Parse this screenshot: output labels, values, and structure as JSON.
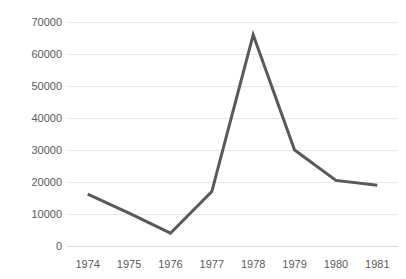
{
  "chart_data": {
    "type": "line",
    "title": "",
    "subtitle": "",
    "xlabel": "",
    "ylabel": "",
    "categories": [
      "1974",
      "1975",
      "1976",
      "1977",
      "1978",
      "1979",
      "1980",
      "1981"
    ],
    "values": [
      16200,
      10300,
      4000,
      17000,
      66000,
      30000,
      20500,
      19000
    ],
    "series": [
      {
        "name": "",
        "values": [
          16200,
          10300,
          4000,
          17000,
          66000,
          30000,
          20500,
          19000
        ]
      }
    ],
    "ylim": [
      0,
      70000
    ],
    "yticks": [
      0,
      10000,
      20000,
      30000,
      40000,
      50000,
      60000,
      70000
    ],
    "ytick_labels": [
      "0",
      "10000",
      "20000",
      "30000",
      "40000",
      "50000",
      "60000",
      "70000"
    ],
    "xtick_labels": [
      "1974",
      "1975",
      "1976",
      "1977",
      "1978",
      "1979",
      "1980",
      "1981"
    ],
    "grid": true,
    "grid_axis": "y",
    "legend": false,
    "legend_position": "none",
    "line_color": "#595959",
    "line_width": 3,
    "markers": false,
    "grid_color": "#e8e8e8",
    "axis_color": "#d9d9d9",
    "tick_label_color": "#595959",
    "background_color": "#ffffff"
  }
}
